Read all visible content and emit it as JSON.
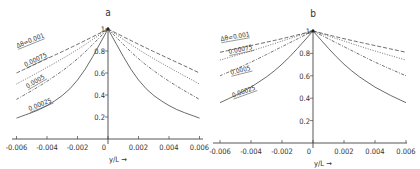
{
  "chart_data": [
    {
      "type": "line",
      "panel_label": "a",
      "xlabel": "y/L",
      "ylabel": "",
      "xlim": [
        -0.006,
        0.006
      ],
      "ylim": [
        0,
        1
      ],
      "x_ticks": [
        "-0.006",
        "-0.004",
        "-0.002",
        "0",
        "0.002",
        "0.004",
        "0.006"
      ],
      "y_ticks": [
        "0.2",
        "0.4",
        "0.6",
        "0.8",
        "1"
      ],
      "grid": false,
      "legend": "inline labels on left branch",
      "x": [
        -0.006,
        -0.004,
        -0.002,
        0,
        0.002,
        0.004,
        0.006
      ],
      "series": [
        {
          "name": "Δθ=0.001",
          "label": "Δθ=0.001",
          "style": "dashed",
          "values": [
            0.6,
            0.73,
            0.86,
            1.0,
            0.86,
            0.73,
            0.6
          ]
        },
        {
          "name": "0.00075",
          "label": "0.00075",
          "style": "dotted",
          "values": [
            0.5,
            0.65,
            0.81,
            1.0,
            0.81,
            0.65,
            0.5
          ]
        },
        {
          "name": "0.0005",
          "label": "0.0005",
          "style": "dashdot",
          "values": [
            0.36,
            0.52,
            0.72,
            1.0,
            0.72,
            0.52,
            0.36
          ]
        },
        {
          "name": "0.00025",
          "label": "0.00025",
          "style": "solid",
          "values": [
            0.19,
            0.29,
            0.5,
            1.0,
            0.5,
            0.29,
            0.19
          ]
        }
      ]
    },
    {
      "type": "line",
      "panel_label": "b",
      "xlabel": "y/L",
      "ylabel": "",
      "xlim": [
        -0.006,
        0.006
      ],
      "ylim": [
        0,
        1
      ],
      "x_ticks": [
        "-0.006",
        "-0.004",
        "-0.002",
        "0",
        "0.002",
        "0.004",
        "0.006"
      ],
      "y_ticks": [
        "0.2",
        "0.4",
        "0.6",
        "0.8",
        "1"
      ],
      "grid": false,
      "legend": "inline labels on left branch",
      "x": [
        -0.006,
        -0.004,
        -0.002,
        0,
        0.002,
        0.004,
        0.006
      ],
      "series": [
        {
          "name": "Δθ=0.001",
          "label": "Δθ=0.001",
          "style": "dashed",
          "values": [
            0.81,
            0.87,
            0.93,
            1.0,
            0.93,
            0.87,
            0.81
          ]
        },
        {
          "name": "0.00075",
          "label": "0.00075",
          "style": "dotted",
          "values": [
            0.74,
            0.82,
            0.91,
            1.0,
            0.91,
            0.82,
            0.74
          ]
        },
        {
          "name": "0.0005",
          "label": "0.0005",
          "style": "dashdot",
          "values": [
            0.6,
            0.72,
            0.86,
            1.0,
            0.86,
            0.72,
            0.6
          ]
        },
        {
          "name": "0.00025",
          "label": "0.00025",
          "style": "solid",
          "values": [
            0.36,
            0.49,
            0.69,
            1.0,
            0.69,
            0.49,
            0.36
          ]
        }
      ]
    }
  ],
  "panels": [
    {
      "label": "a",
      "xlabel": "y/L",
      "arrow": "→"
    },
    {
      "label": "b",
      "xlabel": "y/L",
      "arrow": "→"
    }
  ]
}
